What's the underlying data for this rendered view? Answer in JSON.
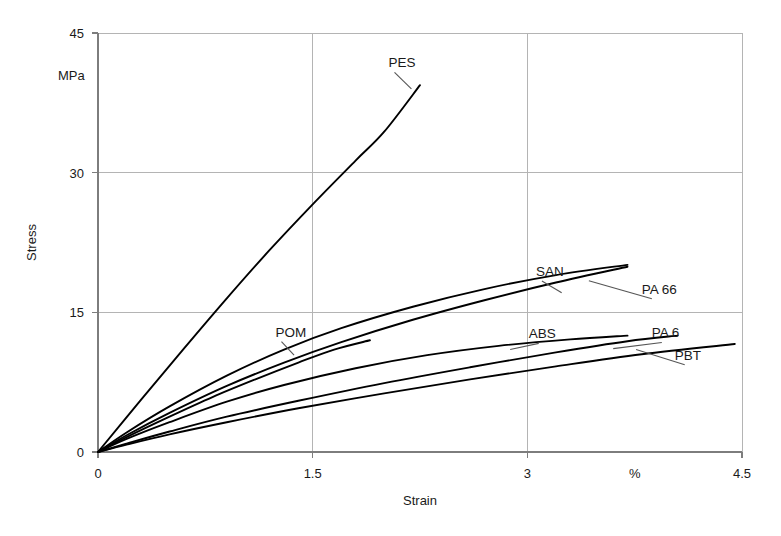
{
  "chart_data": {
    "type": "line",
    "title": "",
    "xlabel": "Strain",
    "ylabel": "Stress",
    "x_unit": "%",
    "y_unit": "MPa",
    "xlim": [
      0,
      4.5
    ],
    "ylim": [
      0,
      45
    ],
    "xticks": [
      "0",
      "1.5",
      "3",
      "4.5"
    ],
    "xtick_values": [
      0,
      1.5,
      3,
      4.5
    ],
    "yticks": [
      "0",
      "15",
      "30",
      "45"
    ],
    "ytick_values": [
      0,
      15,
      30,
      45
    ],
    "grid": true,
    "legend": "inline-labels",
    "series": [
      {
        "name": "PES",
        "label": "PES",
        "points": [
          [
            0,
            0
          ],
          [
            0.3,
            5.6
          ],
          [
            0.6,
            11.1
          ],
          [
            0.9,
            16.5
          ],
          [
            1.2,
            21.7
          ],
          [
            1.5,
            26.6
          ],
          [
            1.8,
            31.3
          ],
          [
            2.0,
            34.4
          ],
          [
            2.25,
            39.4
          ]
        ]
      },
      {
        "name": "SAN",
        "label": "SAN",
        "points": [
          [
            0,
            0
          ],
          [
            0.2,
            2.1
          ],
          [
            0.5,
            4.9
          ],
          [
            0.9,
            8.2
          ],
          [
            1.3,
            11.0
          ],
          [
            1.7,
            13.3
          ],
          [
            2.2,
            15.6
          ],
          [
            2.7,
            17.5
          ],
          [
            3.2,
            19.0
          ],
          [
            3.7,
            20.1
          ]
        ]
      },
      {
        "name": "PA 66",
        "label": "PA 66",
        "points": [
          [
            0,
            0
          ],
          [
            0.2,
            1.8
          ],
          [
            0.5,
            4.2
          ],
          [
            0.9,
            7.1
          ],
          [
            1.3,
            9.6
          ],
          [
            1.7,
            11.8
          ],
          [
            2.2,
            14.2
          ],
          [
            2.7,
            16.3
          ],
          [
            3.2,
            18.2
          ],
          [
            3.7,
            19.9
          ]
        ]
      },
      {
        "name": "POM",
        "label": "POM",
        "points": [
          [
            0,
            0
          ],
          [
            0.2,
            1.6
          ],
          [
            0.5,
            3.8
          ],
          [
            0.8,
            5.9
          ],
          [
            1.1,
            7.8
          ],
          [
            1.4,
            9.6
          ],
          [
            1.65,
            11.0
          ],
          [
            1.9,
            12.0
          ]
        ]
      },
      {
        "name": "ABS",
        "label": "ABS",
        "points": [
          [
            0,
            0
          ],
          [
            0.2,
            1.4
          ],
          [
            0.5,
            3.2
          ],
          [
            0.9,
            5.4
          ],
          [
            1.3,
            7.2
          ],
          [
            1.8,
            9.0
          ],
          [
            2.3,
            10.4
          ],
          [
            2.8,
            11.4
          ],
          [
            3.3,
            12.1
          ],
          [
            3.7,
            12.5
          ]
        ]
      },
      {
        "name": "PA 6",
        "label": "PA 6",
        "points": [
          [
            0,
            0
          ],
          [
            0.2,
            0.9
          ],
          [
            0.5,
            2.2
          ],
          [
            0.9,
            3.8
          ],
          [
            1.4,
            5.5
          ],
          [
            2.0,
            7.4
          ],
          [
            2.6,
            9.1
          ],
          [
            3.2,
            10.7
          ],
          [
            3.7,
            11.9
          ],
          [
            4.05,
            12.5
          ]
        ]
      },
      {
        "name": "PBT",
        "label": "PBT",
        "points": [
          [
            0,
            0
          ],
          [
            0.2,
            0.8
          ],
          [
            0.5,
            1.9
          ],
          [
            0.9,
            3.2
          ],
          [
            1.4,
            4.7
          ],
          [
            2.0,
            6.3
          ],
          [
            2.6,
            7.8
          ],
          [
            3.2,
            9.2
          ],
          [
            3.8,
            10.5
          ],
          [
            4.45,
            11.6
          ]
        ]
      }
    ],
    "annotations": [
      {
        "text": "PES",
        "anchor": "start",
        "x": 2.03,
        "y": 41.3,
        "leader_to": [
          2.19,
          39.0
        ]
      },
      {
        "text": "SAN",
        "anchor": "start",
        "x": 3.06,
        "y": 18.9,
        "leader_to": [
          3.24,
          17.1
        ]
      },
      {
        "text": "PA 66",
        "anchor": "start",
        "x": 3.8,
        "y": 17.0,
        "leader_to": [
          3.43,
          18.4
        ]
      },
      {
        "text": "POM",
        "anchor": "start",
        "x": 1.24,
        "y": 12.4,
        "leader_to": [
          1.37,
          10.4
        ]
      },
      {
        "text": "ABS",
        "anchor": "start",
        "x": 3.01,
        "y": 12.2,
        "leader_to": [
          2.88,
          11.0
        ]
      },
      {
        "text": "PA 6",
        "anchor": "start",
        "x": 3.87,
        "y": 12.3,
        "leader_to": [
          3.6,
          11.1
        ]
      },
      {
        "text": "PBT",
        "anchor": "start",
        "x": 4.03,
        "y": 9.9,
        "leader_to": [
          3.76,
          11.0
        ]
      }
    ]
  },
  "axes": {
    "y_unit_label": "MPa",
    "y_title": "Stress",
    "x_title": "Strain",
    "x_unit_label": "%",
    "x_unit_position": 3.75
  },
  "colors": {
    "curve": "#000000",
    "grid": "#b4b4b4",
    "axis": "#7d7d7d",
    "text": "#1a1a1a",
    "background": "#ffffff",
    "leader": "#555555"
  }
}
